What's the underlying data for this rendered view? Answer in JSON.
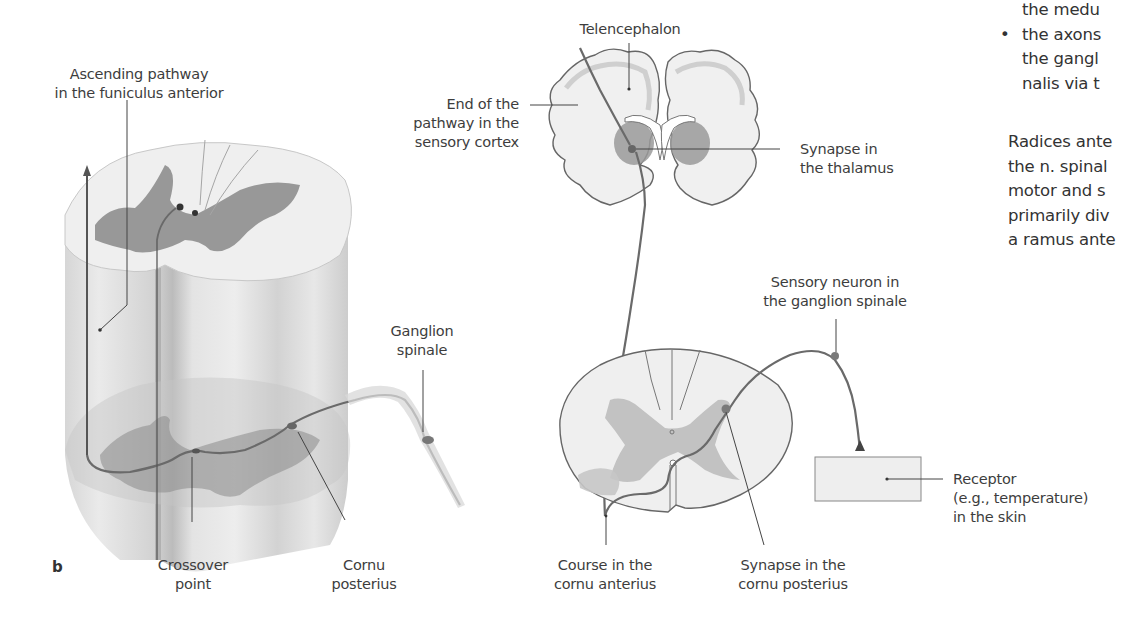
{
  "figure": {
    "panel_letter": "b",
    "colors": {
      "pathway": "#6e6e6e",
      "gray_matter_dark": "#8a8a8a",
      "gray_matter_light": "#b9b9b9",
      "white_matter": "#e6e6e6",
      "outline": "#5a5a5a",
      "leader_line": "#444444",
      "receptor_box": "#eeeeee"
    },
    "left_diagram": {
      "labels": {
        "ascending_pathway": [
          "Ascending pathway",
          "in the funiculus anterior"
        ],
        "ganglion_spinale": [
          "Ganglion",
          "spinale"
        ],
        "crossover_point": [
          "Crossover",
          "point"
        ],
        "cornu_posterius": [
          "Cornu",
          "posterius"
        ]
      }
    },
    "right_diagram": {
      "labels": {
        "telencephalon": [
          "Telencephalon"
        ],
        "end_of_pathway": [
          "End of the",
          "pathway in the",
          "sensory cortex"
        ],
        "synapse_thalamus": [
          "Synapse in",
          "the thalamus"
        ],
        "sensory_neuron": [
          "Sensory neuron in",
          "the ganglion spinale"
        ],
        "receptor": [
          "Receptor",
          "(e.g., temperature)",
          "in the skin"
        ],
        "course_cornu_anterius": [
          "Course in the",
          "cornu anterius"
        ],
        "synapse_cornu_posterius": [
          "Synapse in the",
          "cornu posterius"
        ]
      }
    }
  },
  "body_text": {
    "bullet_lines": [
      {
        "bullet": false,
        "text": "the medu"
      },
      {
        "bullet": true,
        "text": "the axons"
      },
      {
        "bullet": false,
        "text": "the gangl"
      },
      {
        "bullet": false,
        "text": "nalis via t"
      }
    ],
    "paragraph_lines": [
      "Radices ante",
      "the n. spinal",
      "motor and s",
      "primarily div",
      "a ramus ante"
    ],
    "bullet_glyph": "•"
  }
}
